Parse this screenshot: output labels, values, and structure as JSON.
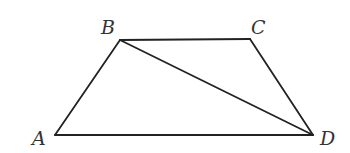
{
  "diagram": {
    "type": "geometry-figure",
    "shape": "trapezoid",
    "stroke_color": "#222222",
    "label_color": "#333333",
    "vertices": [
      {
        "name": "A",
        "x": 55,
        "y": 135,
        "label_x": 32,
        "label_y": 145
      },
      {
        "name": "B",
        "x": 120,
        "y": 40,
        "label_x": 101,
        "label_y": 34
      },
      {
        "name": "C",
        "x": 250,
        "y": 39,
        "label_x": 251,
        "label_y": 34
      },
      {
        "name": "D",
        "x": 313,
        "y": 135,
        "label_x": 320,
        "label_y": 145
      }
    ],
    "segments": [
      {
        "from": "A",
        "to": "B"
      },
      {
        "from": "B",
        "to": "C"
      },
      {
        "from": "C",
        "to": "D"
      },
      {
        "from": "D",
        "to": "A"
      },
      {
        "from": "B",
        "to": "D",
        "role": "diagonal"
      }
    ]
  }
}
